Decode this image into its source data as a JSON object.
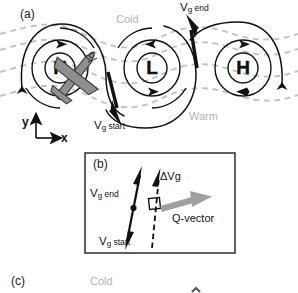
{
  "figure": {
    "panels": [
      {
        "tag": "(a)",
        "name": "synoptic-wave-pattern"
      },
      {
        "tag": "(b)",
        "name": "q-vector-construction"
      },
      {
        "tag": "(c)",
        "name": "lower-panel"
      }
    ]
  },
  "panel_a": {
    "tag": "(a)",
    "airmass_cold": "Cold",
    "airmass_warm": "Warm",
    "pressure_centers": [
      {
        "symbol": "H",
        "type": "high",
        "rotation": "clockwise",
        "x": 60,
        "y": 68
      },
      {
        "symbol": "L",
        "type": "low",
        "rotation": "counterclockwise",
        "x": 152,
        "y": 68
      },
      {
        "symbol": "H",
        "type": "high",
        "rotation": "clockwise",
        "x": 243,
        "y": 68
      }
    ],
    "vector_start_label": {
      "base": "V",
      "sub": "g",
      "suffix": "start"
    },
    "vector_end_label": {
      "base": "V",
      "sub": "g",
      "suffix": "end"
    },
    "axis_y": "y",
    "axis_x": "x",
    "aircraft_icon": "airplane-icon"
  },
  "panel_b": {
    "tag": "(b)",
    "vector_end_label": {
      "base": "V",
      "sub": "g",
      "suffix": "end"
    },
    "vector_start_label": {
      "base": "V",
      "sub": "g",
      "suffix": "start"
    },
    "delta_label": {
      "base": "ΔV",
      "sub": "g"
    },
    "q_vector_label": "Q-vector",
    "right_angle_marker": "right-angle-icon"
  },
  "panel_c": {
    "tag": "(c)",
    "airmass_cold": "Cold"
  },
  "colors": {
    "ink": "#111111",
    "isotherm_gray": "#c0c0c0",
    "airmass_text_gray": "#b3b3b3",
    "q_vector_gray": "#a0a0a0",
    "aircraft_gray": "#8f8f8f",
    "panel_border": "#3a3a3a",
    "background": "#ffffff"
  }
}
